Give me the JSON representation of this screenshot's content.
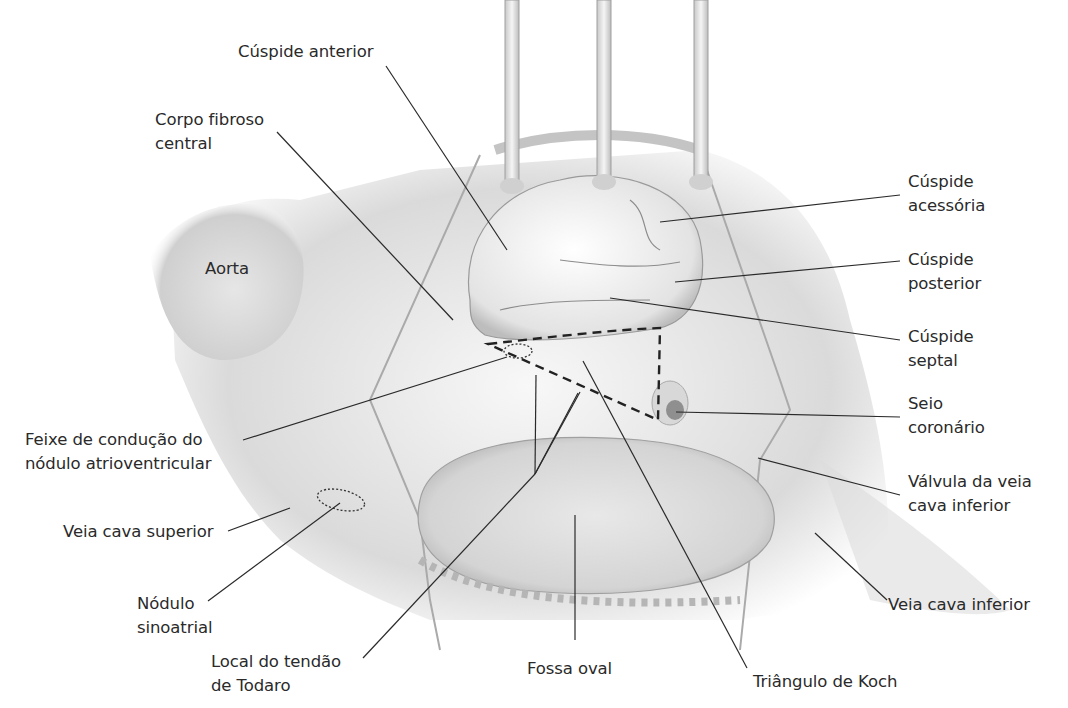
{
  "figure": {
    "labels": {
      "cuspide_anterior": [
        "Cúspide anterior"
      ],
      "corpo_fibroso": [
        "Corpo fibroso",
        "central"
      ],
      "aorta": [
        "Aorta"
      ],
      "cuspide_acessoria": [
        "Cúspide",
        "acessória"
      ],
      "cuspide_posterior": [
        "Cúspide",
        "posterior"
      ],
      "cuspide_septal": [
        "Cúspide",
        "septal"
      ],
      "seio_coronario": [
        "Seio",
        "coronário"
      ],
      "feixe": [
        "Feixe de condução do",
        "nódulo atrioventricular"
      ],
      "valvula_vci": [
        "Válvula da veia",
        "cava inferior"
      ],
      "vcs": [
        "Veia cava superior"
      ],
      "nodulo_sa": [
        "Nódulo",
        "sinoatrial"
      ],
      "vci": [
        "Veia cava inferior"
      ],
      "todaro": [
        "Local do tendão",
        "de Todaro"
      ],
      "fossa_oval": [
        "Fossa oval"
      ],
      "koch": [
        "Triângulo de Koch"
      ]
    },
    "colors": {
      "line": "#2a2a2a",
      "tissue_light": "#f2f2f2",
      "tissue_mid": "#d9d9d9",
      "tissue_dark": "#a8a8a8"
    }
  }
}
